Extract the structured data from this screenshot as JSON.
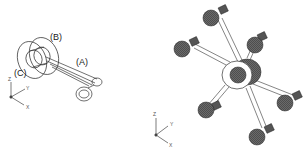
{
  "figure": {
    "left": {
      "title": "single-arm-assembly",
      "callouts": [
        {
          "id": "A",
          "text": "(A)"
        },
        {
          "id": "B",
          "text": "(B)"
        },
        {
          "id": "C",
          "text": "(C)"
        }
      ],
      "ucs": {
        "z": "Z",
        "y": "Y",
        "x": "X"
      }
    },
    "right": {
      "title": "six-arm-spider-assembly",
      "arm_count": 6,
      "ucs": {
        "z": "Z",
        "y": "Y",
        "x": "X"
      }
    },
    "colors": {
      "line": "#333333",
      "ball_fill": "#5a5a5a",
      "ball_dark": "#2e2e2e",
      "background": "#ffffff"
    }
  }
}
